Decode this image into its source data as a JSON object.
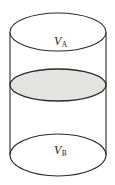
{
  "figure": {
    "type": "cylinder-cross-section-diagram",
    "background_color": "#ffffff",
    "stroke_color": "#2b2b2b",
    "shaded_fill_color": "#e3e3df",
    "labels": {
      "top_volume": {
        "symbol": "V",
        "subscript": "A",
        "full_text": "VA"
      },
      "bottom_volume": {
        "symbol": "V",
        "subscript": "B",
        "full_text": "VB"
      }
    },
    "geometry": {
      "cylinder_left_x": 10,
      "cylinder_right_x": 106,
      "top_ellipse_center_y": 32,
      "top_ellipse_rx": 48,
      "top_ellipse_ry": 19,
      "middle_ellipse_center_y": 85,
      "middle_ellipse_rx": 48,
      "middle_ellipse_ry": 16,
      "bottom_ellipse_center_y": 155,
      "bottom_ellipse_rx": 48,
      "bottom_ellipse_ry": 21
    }
  }
}
